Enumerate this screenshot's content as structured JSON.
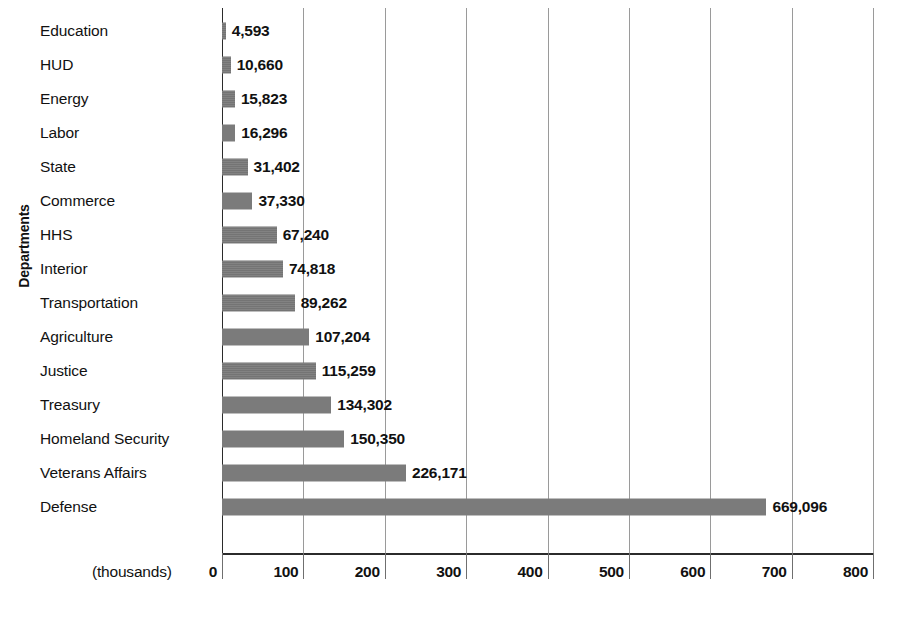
{
  "chart_data": {
    "type": "bar",
    "orientation": "horizontal",
    "title": "",
    "xlabel": "(thousands)",
    "ylabel": "Departments",
    "xlim": [
      0,
      800
    ],
    "xticks": [
      0,
      100,
      200,
      300,
      400,
      500,
      600,
      700,
      800
    ],
    "xtick_labels": [
      "0",
      "100",
      "200",
      "300",
      "400",
      "500",
      "600",
      "700",
      "800"
    ],
    "grid": true,
    "legend": "none",
    "units_note": "(thousands)",
    "value_unit_multiplier": 1000,
    "categories": [
      "Education",
      "HUD",
      "Energy",
      "Labor",
      "State",
      "Commerce",
      "HHS",
      "Interior",
      "Transportation",
      "Agriculture",
      "Justice",
      "Treasury",
      "Homeland Security",
      "Veterans Affairs",
      "Defense"
    ],
    "values": [
      4593,
      10660,
      15823,
      16296,
      31402,
      37330,
      67240,
      74818,
      89262,
      107204,
      115259,
      134302,
      150350,
      226171,
      669096
    ],
    "value_labels": [
      "4,593",
      "10,660",
      "15,823",
      "16,296",
      "31,402",
      "37,330",
      "67,240",
      "74,818",
      "89,262",
      "107,204",
      "115,259",
      "134,302",
      "150,350",
      "226,171",
      "669,096"
    ],
    "bar_color": "#7a7a7a",
    "axis_color": "#2b2b2b",
    "gridline_color": "#9a9a9a",
    "text_color": "#111111",
    "background": "#ffffff"
  },
  "caption": ""
}
